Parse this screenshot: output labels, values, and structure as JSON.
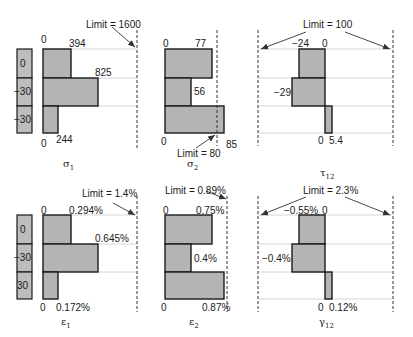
{
  "colors": {
    "bar_fill": "#b4b4b4",
    "bar_stroke": "#1a1a1a",
    "gridline": "#d6d6d6",
    "limit_line": "#333333",
    "ply_fill": "#bdbdbd"
  },
  "ply_stack_top": {
    "plies": [
      "0",
      "−30",
      "−30"
    ]
  },
  "ply_stack_bottom": {
    "plies": [
      "0",
      "−30",
      "30"
    ]
  },
  "panels": {
    "sigma1": {
      "symbol": "σ",
      "subscript": "1",
      "limit_label": "Limit = 1600",
      "zero_top": "0",
      "zero_bottom": "0",
      "values": [
        "394",
        "825",
        "244"
      ]
    },
    "sigma2": {
      "symbol": "σ",
      "subscript": "2",
      "limit_label": "Limit = 80",
      "zero_top": "0",
      "zero_bottom": "0",
      "values": [
        "77",
        "56",
        "85"
      ]
    },
    "tau12": {
      "symbol": "τ",
      "subscript": "12",
      "limit_label": "Limit = 100",
      "zero_top": "0",
      "zero_bottom": "0",
      "values": [
        "−24",
        "−29",
        "5.4"
      ]
    },
    "eps1": {
      "symbol": "ε",
      "subscript": "1",
      "limit_label": "Limit = 1.4%",
      "zero_top": "0",
      "zero_bottom": "0",
      "values": [
        "0.294%",
        "0.645%",
        "0.172%"
      ]
    },
    "eps2": {
      "symbol": "ε",
      "subscript": "2",
      "limit_label": "Limit = 0.89%",
      "zero_top": "0",
      "zero_bottom": "0",
      "values": [
        "0.75%",
        "0.4%",
        "0.87%"
      ]
    },
    "gamma12": {
      "symbol": "γ",
      "subscript": "12",
      "limit_label": "Limit = 2.3%",
      "zero_top": "0",
      "zero_bottom": "0",
      "values": [
        "−0.55%",
        "−0.4%",
        "0.12%"
      ]
    }
  }
}
